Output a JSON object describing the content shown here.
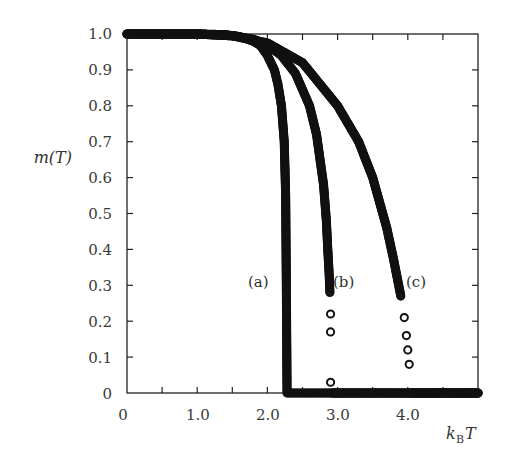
{
  "chart_data": {
    "type": "scatter",
    "title": "",
    "xlabel": "k_B T",
    "ylabel": "m(T)",
    "xlim": [
      0,
      5.0
    ],
    "ylim": [
      0,
      1.0
    ],
    "grid": false,
    "legend": "none (inline labels (a), (b), (c))",
    "x_ticks": [
      0,
      1.0,
      2.0,
      3.0,
      4.0
    ],
    "x_tick_labels": [
      "0",
      "1.0",
      "2.0",
      "3.0",
      "4.0"
    ],
    "y_ticks": [
      0,
      0.1,
      0.2,
      0.3,
      0.4,
      0.5,
      0.6,
      0.7,
      0.8,
      0.9,
      1.0
    ],
    "y_tick_labels": [
      "0",
      "0.1",
      "0.2",
      "0.3",
      "0.4",
      "0.5",
      "0.6",
      "0.7",
      "0.8",
      "0.9",
      "1.0"
    ],
    "series": [
      {
        "name": "(a)",
        "label_pos": {
          "x": 1.85,
          "y": 0.33
        },
        "Tc": 2.27,
        "x": [
          0,
          0.5,
          1.0,
          1.4,
          1.6,
          1.8,
          1.9,
          2.0,
          2.1,
          2.15,
          2.2,
          2.24,
          2.26,
          2.27,
          2.28,
          2.5,
          3.0,
          3.5,
          4.0,
          4.5,
          5.0
        ],
        "values": [
          1.0,
          1.0,
          1.0,
          0.998,
          0.993,
          0.98,
          0.968,
          0.94,
          0.9,
          0.86,
          0.8,
          0.7,
          0.55,
          0.3,
          0.0,
          0.0,
          0.0,
          0.0,
          0.0,
          0.0,
          0.0
        ]
      },
      {
        "name": "(b)",
        "label_pos": {
          "x": 3.05,
          "y": 0.33
        },
        "Tc": 2.9,
        "x": [
          0,
          0.5,
          1.0,
          1.5,
          1.8,
          2.0,
          2.2,
          2.4,
          2.6,
          2.7,
          2.8,
          2.84,
          2.86,
          2.88,
          2.89,
          2.9,
          2.9,
          2.9,
          2.92,
          3.0,
          3.5,
          4.0,
          4.5,
          5.0
        ],
        "values": [
          1.0,
          1.0,
          1.0,
          0.995,
          0.985,
          0.97,
          0.94,
          0.89,
          0.8,
          0.72,
          0.58,
          0.48,
          0.4,
          0.33,
          0.28,
          0.22,
          0.17,
          0.03,
          0.0,
          0.0,
          0.0,
          0.0,
          0.0,
          0.0
        ]
      },
      {
        "name": "(c)",
        "label_pos": {
          "x": 4.12,
          "y": 0.33
        },
        "Tc": 4.02,
        "x": [
          0,
          0.5,
          1.0,
          1.5,
          2.0,
          2.5,
          3.0,
          3.3,
          3.5,
          3.7,
          3.8,
          3.9,
          3.95,
          3.98,
          4.0,
          4.02,
          4.05,
          4.5,
          5.0
        ],
        "values": [
          1.0,
          1.0,
          1.0,
          0.995,
          0.975,
          0.92,
          0.8,
          0.7,
          0.6,
          0.46,
          0.37,
          0.27,
          0.21,
          0.16,
          0.12,
          0.08,
          0.0,
          0.0,
          0.0
        ]
      }
    ]
  },
  "labels": {
    "y_axis": "m(T)",
    "x_axis_k": "k",
    "x_axis_sub": "B",
    "x_axis_T": "T",
    "curve_a": "(a)",
    "curve_b": "(b)",
    "curve_c": "(c)"
  },
  "y_ticks": [
    "1.0",
    "0.9",
    "0.8",
    "0.7",
    "0.6",
    "0.5",
    "0.4",
    "0.3",
    "0.2",
    "0.1",
    "0"
  ],
  "x_ticks": [
    "0",
    "1.0",
    "2.0",
    "3.0",
    "4.0"
  ],
  "colors": {
    "marker": "#111111",
    "axis": "#222222",
    "text": "#3a3a3a"
  }
}
